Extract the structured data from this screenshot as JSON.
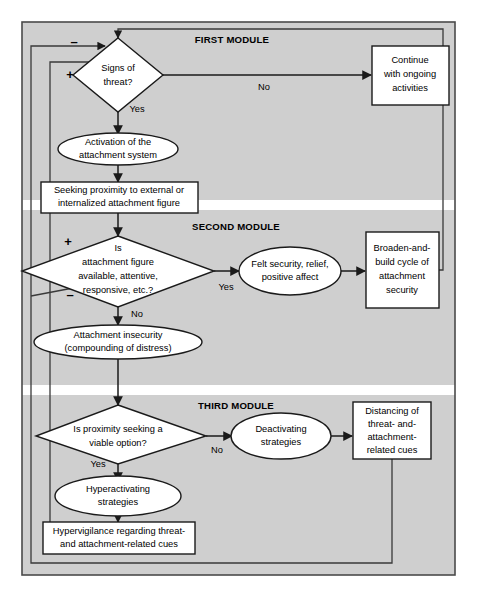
{
  "figure": {
    "background": "#ffffff",
    "band_color": "#cfcfcf",
    "frame_color": "#4a4a4a",
    "node_fill": "#ffffff",
    "line_color": "#1a1a1a"
  },
  "modules": [
    {
      "id": "first",
      "label": "FIRST MODULE"
    },
    {
      "id": "second",
      "label": "SECOND MODULE"
    },
    {
      "id": "third",
      "label": "THIRD MODULE"
    }
  ],
  "nodes": {
    "signs_of_threat": {
      "shape": "diamond",
      "line1": "Signs of",
      "line2": "threat?"
    },
    "continue_activities": {
      "shape": "box",
      "line1": "Continue",
      "line2": "with ongoing",
      "line3": "activities"
    },
    "activation": {
      "shape": "ellipse",
      "line1": "Activation of the",
      "line2": "attachment system"
    },
    "seeking_proximity": {
      "shape": "box",
      "line1": "Seeking proximity to external or",
      "line2": "internalized attachment figure"
    },
    "attachment_available": {
      "shape": "diamond",
      "line1": "Is",
      "line2": "attachment figure",
      "line3": "available, attentive,",
      "line4": "responsive, etc.?"
    },
    "felt_security": {
      "shape": "ellipse",
      "line1": "Felt security, relief,",
      "line2": "positive affect"
    },
    "broaden_build": {
      "shape": "box",
      "line1": "Broaden-and-",
      "line2": "build cycle of",
      "line3": "attachment",
      "line4": "security"
    },
    "attachment_insecurity": {
      "shape": "ellipse",
      "line1": "Attachment insecurity",
      "line2": "(compounding of distress)"
    },
    "proximity_viable": {
      "shape": "diamond",
      "line1": "Is proximity seeking a",
      "line2": "viable option?"
    },
    "deactivating": {
      "shape": "ellipse",
      "line1": "Deactivating",
      "line2": "strategies"
    },
    "distancing": {
      "shape": "box",
      "line1": "Distancing of",
      "line2": "threat- and-",
      "line3": "attachment-",
      "line4": "related cues"
    },
    "hyperactivating": {
      "shape": "ellipse",
      "line1": "Hyperactivating",
      "line2": "strategies"
    },
    "hypervigilance": {
      "shape": "box",
      "line1": "Hypervigilance regarding threat-",
      "line2": "and attachment-related cues"
    }
  },
  "edge_labels": {
    "threat_no": "No",
    "threat_yes": "Yes",
    "available_yes": "Yes",
    "available_no": "No",
    "viable_no": "No",
    "viable_yes": "Yes",
    "minus_top": "–",
    "plus_top": "+",
    "plus_second": "+",
    "minus_second": "–"
  }
}
